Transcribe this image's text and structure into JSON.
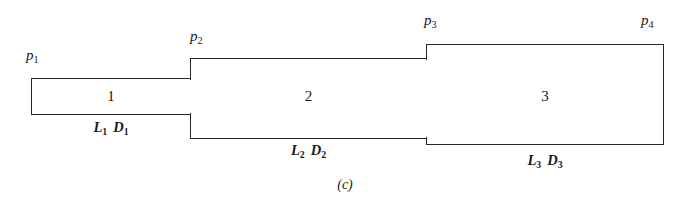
{
  "figure": {
    "caption": "(c)",
    "line_color": "#262626",
    "background_color": "#ffffff"
  },
  "pipes": [
    {
      "number": "1",
      "inlet_pressure_symbol": "p",
      "inlet_pressure_subscript": "1",
      "length_symbol": "L",
      "length_subscript": "1",
      "diameter_symbol": "D",
      "diameter_subscript": "1"
    },
    {
      "number": "2",
      "inlet_pressure_symbol": "p",
      "inlet_pressure_subscript": "2",
      "length_symbol": "L",
      "length_subscript": "2",
      "diameter_symbol": "D",
      "diameter_subscript": "2"
    },
    {
      "number": "3",
      "inlet_pressure_symbol": "p",
      "inlet_pressure_subscript": "3",
      "length_symbol": "L",
      "length_subscript": "3",
      "diameter_symbol": "D",
      "diameter_subscript": "3"
    }
  ],
  "outlet": {
    "pressure_symbol": "p",
    "pressure_subscript": "4"
  }
}
